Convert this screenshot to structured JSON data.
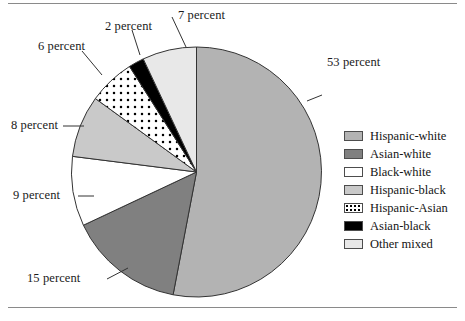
{
  "figure": {
    "background_color": "#ffffff",
    "rule_color": "#8a8a8a"
  },
  "chart_data": {
    "type": "pie",
    "title": "",
    "subtitle": "",
    "xlabel": "",
    "ylabel": "",
    "legend_position": "right",
    "grid": false,
    "start_angle_deg": 0,
    "direction": "clockwise",
    "unit": "percent",
    "categories": [
      "Hispanic-white",
      "Asian-white",
      "Black-white",
      "Hispanic-black",
      "Hispanic-Asian",
      "Asian-black",
      "Other mixed"
    ],
    "values": [
      53,
      15,
      9,
      8,
      6,
      2,
      7
    ],
    "data_labels": [
      "53 percent",
      "15 percent",
      "9 percent",
      "8 percent",
      "6 percent",
      "2 percent",
      "7 percent"
    ],
    "slice_colors": [
      "#b3b3b3",
      "#808080",
      "#ffffff",
      "#c9c9c9",
      "#ffffff",
      "#000000",
      "#e8e8e8"
    ],
    "slice_fill_styles": [
      "solid",
      "solid",
      "solid",
      "solid",
      "dotted",
      "solid",
      "solid"
    ],
    "slice_edge_color": "#333333"
  },
  "callouts": [
    {
      "id": "pct-53",
      "text": "53 percent"
    },
    {
      "id": "pct-15",
      "text": "15 percent"
    },
    {
      "id": "pct-9",
      "text": "9 percent"
    },
    {
      "id": "pct-8",
      "text": "8 percent"
    },
    {
      "id": "pct-6",
      "text": "6 percent"
    },
    {
      "id": "pct-2",
      "text": "2 percent"
    },
    {
      "id": "pct-7",
      "text": "7 percent"
    }
  ],
  "legend": {
    "items": [
      {
        "label": "Hispanic-white",
        "color": "#b3b3b3",
        "style": "solid"
      },
      {
        "label": "Asian-white",
        "color": "#808080",
        "style": "solid"
      },
      {
        "label": "Black-white",
        "color": "#ffffff",
        "style": "solid"
      },
      {
        "label": "Hispanic-black",
        "color": "#c9c9c9",
        "style": "solid"
      },
      {
        "label": "Hispanic-Asian",
        "color": "#ffffff",
        "style": "dotted"
      },
      {
        "label": "Asian-black",
        "color": "#000000",
        "style": "solid"
      },
      {
        "label": "Other mixed",
        "color": "#e8e8e8",
        "style": "solid"
      }
    ]
  }
}
